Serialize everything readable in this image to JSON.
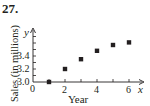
{
  "problem_number": "27.",
  "chart_data": {
    "type": "scatter",
    "title": "",
    "xlabel": "Year",
    "ylabel": "Sales (in millions)",
    "x_axis_var": "x",
    "y_axis_var": "y",
    "x": [
      1,
      2,
      3,
      4,
      5,
      6
    ],
    "values": [
      3.0,
      3.2,
      3.35,
      3.48,
      3.57,
      3.61
    ],
    "x_ticks": [
      "0",
      "2",
      "4",
      "6"
    ],
    "y_ticks": [
      "3.0",
      "3.2",
      "3.4"
    ],
    "xlim": [
      0,
      7
    ],
    "ylim": [
      3.0,
      3.7
    ],
    "y_axis_break_origin": "3.0",
    "grid": false,
    "legend": null,
    "marker": "square",
    "marker_color": "#231f20"
  }
}
